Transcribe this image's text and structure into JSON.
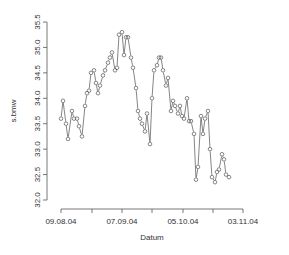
{
  "chart_data": {
    "type": "line",
    "title": "",
    "xlabel": "Datum",
    "ylabel": "s.bmw",
    "ylim": [
      32.0,
      35.5
    ],
    "yticks": [
      "32.0",
      "32.5",
      "33.0",
      "33.5",
      "34.0",
      "34.5",
      "35.0",
      "35.5"
    ],
    "xticks": [
      "09.08.04",
      "07.09.04",
      "05.10.04",
      "03.11.04"
    ],
    "grid": false,
    "legend": null,
    "marker": "open-circle",
    "series": [
      {
        "name": "s.bmw",
        "x_px": [
          61,
          63,
          66,
          68,
          72,
          74,
          77,
          79,
          82,
          85,
          87,
          89,
          91,
          94,
          96,
          98,
          100,
          103,
          105,
          108,
          110,
          112,
          115,
          117,
          119,
          122,
          124,
          126,
          128,
          131,
          133,
          136,
          138,
          140,
          142,
          145,
          147,
          150,
          152,
          154,
          157,
          159,
          161,
          163,
          166,
          168,
          171,
          173,
          175,
          178,
          180,
          182,
          184,
          187,
          189,
          191,
          194,
          196,
          198,
          201,
          203,
          205,
          208,
          210,
          212,
          215,
          217,
          219,
          222,
          224,
          226,
          229,
          231,
          233,
          236,
          238,
          240,
          243,
          245,
          247,
          250,
          252,
          255,
          257,
          259,
          262,
          264,
          267,
          269,
          271
        ],
        "values": [
          33.6,
          33.95,
          33.5,
          33.2,
          33.75,
          33.6,
          33.6,
          33.45,
          33.25,
          33.85,
          34.1,
          34.15,
          34.5,
          34.55,
          34.3,
          34.1,
          34.25,
          34.45,
          34.55,
          34.7,
          34.8,
          34.9,
          34.55,
          34.6,
          35.25,
          35.3,
          34.85,
          35.2,
          35.2,
          34.8,
          34.6,
          34.2,
          33.75,
          33.6,
          33.5,
          33.35,
          33.7,
          33.1,
          34.0,
          34.55,
          34.65,
          34.8,
          34.8,
          34.55,
          34.25,
          34.4,
          33.75,
          33.95,
          33.85,
          33.7,
          33.85,
          33.65,
          33.6,
          34.0,
          33.55,
          33.55,
          33.3,
          32.4,
          32.65,
          33.65,
          33.3,
          33.6,
          33.75,
          33.0,
          32.45,
          32.35,
          32.55,
          32.6,
          32.9,
          32.8,
          32.5,
          32.45
        ]
      }
    ]
  }
}
